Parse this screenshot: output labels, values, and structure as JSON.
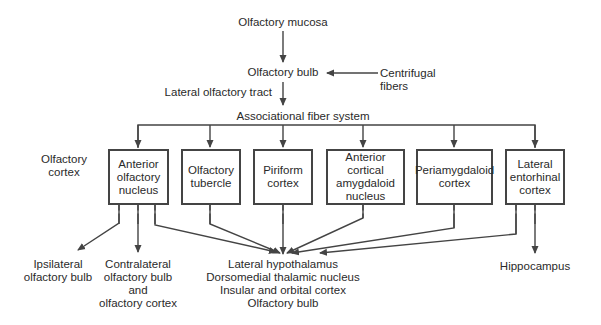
{
  "diagram": {
    "top_nodes": {
      "mucosa": "Olfactory mucosa",
      "bulb": "Olfactory bulb",
      "centrifugal": "Centrifugal\nfibers",
      "tract": "Lateral olfactory tract"
    },
    "cortex_region": {
      "label": "Olfactory\ncortex",
      "associational": "Associational fiber system"
    },
    "boxes": [
      {
        "id": "anterior-olfactory-nucleus",
        "label": "Anterior\nolfactory\nnucleus"
      },
      {
        "id": "olfactory-tubercle",
        "label": "Olfactory\ntubercle"
      },
      {
        "id": "piriform-cortex",
        "label": "Piriform\ncortex"
      },
      {
        "id": "anterior-cortical-amygdaloid-nucleus",
        "label": "Anterior\ncortical\namygdaloid\nnucleus"
      },
      {
        "id": "periamygdaloid-cortex",
        "label": "Periamygdaloid\ncortex"
      },
      {
        "id": "lateral-entorhinal-cortex",
        "label": "Lateral\nentorhinal\ncortex"
      }
    ],
    "outputs": {
      "ipsilateral": "Ipsilateral\nolfactory bulb",
      "contralateral": "Contralateral\nolfactory bulb\nand\nolfactory cortex",
      "central": "Lateral hypothalamus\nDorsomedial thalamic nucleus\nInsular and orbital cortex\nOlfactory bulb",
      "hippocampus": "Hippocampus"
    },
    "colors": {
      "line": "#444444",
      "text": "#2a2a2a",
      "background": "#ffffff"
    }
  }
}
